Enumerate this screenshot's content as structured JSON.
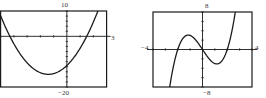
{
  "chart_data": [
    {
      "type": "line",
      "title": "",
      "window": {
        "xmin": -5,
        "xmax": 3,
        "ymin": -20,
        "ymax": 10
      },
      "labels": {
        "top": "10",
        "right": "3",
        "bottom": "−20"
      },
      "series": [
        {
          "name": "parabola",
          "kind": "quadratic",
          "vertex": [
            -1.4,
            -15
          ],
          "roots": [
            -4.3,
            1.5
          ]
        }
      ],
      "grid": false,
      "x_ticks_every": 1,
      "y_ticks_every": 2
    },
    {
      "type": "line",
      "title": "",
      "window": {
        "xmin": -4,
        "xmax": 4,
        "ymin": -8,
        "ymax": 8
      },
      "labels": {
        "top": "8",
        "left": "−4",
        "right": "4",
        "bottom": "−8"
      },
      "series": [
        {
          "name": "cubic",
          "kind": "cubic",
          "roots": [
            -2,
            0,
            2
          ],
          "local_max": [
            -1.15,
            3.1
          ],
          "local_min": [
            1.15,
            -3.1
          ]
        }
      ],
      "grid": false,
      "x_ticks_every": 1,
      "y_ticks_every": 2
    }
  ],
  "colors": {
    "frame": "#1a1a1a",
    "curve": "#1a1a1a",
    "background": "#ffffff"
  }
}
